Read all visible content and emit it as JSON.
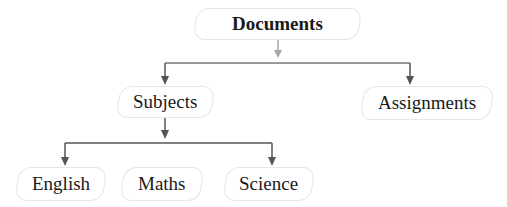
{
  "diagram": {
    "type": "tree",
    "root": {
      "label": "Documents",
      "children": [
        {
          "label": "Subjects",
          "children": [
            {
              "label": "English"
            },
            {
              "label": "Maths"
            },
            {
              "label": "Science"
            }
          ]
        },
        {
          "label": "Assignments"
        }
      ]
    }
  },
  "nodes": {
    "documents": "Documents",
    "subjects": "Subjects",
    "assignments": "Assignments",
    "english": "English",
    "maths": "Maths",
    "science": "Science"
  },
  "colors": {
    "top_connector": "#a6a6a6",
    "connector": "#555555",
    "node_border": "#e6e6e6"
  }
}
